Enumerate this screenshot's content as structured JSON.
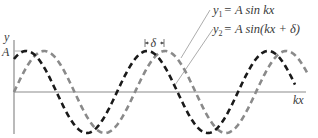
{
  "figure": {
    "y_axis_label": "y",
    "x_axis_label": "kx",
    "amplitude_label": "A",
    "phase_label": "δ",
    "equations": [
      {
        "lhs_var": "y",
        "lhs_sub": "1",
        "rhs": "= A sin kx",
        "curve": "gray"
      },
      {
        "lhs_var": "y",
        "lhs_sub": "2",
        "rhs": "= A sin(kx + δ)",
        "curve": "black"
      }
    ]
  },
  "colors": {
    "curve_y1": "#8a8a8a",
    "curve_y2": "#1a1a1a",
    "axis": "#8c8c8c",
    "text": "#3a3a3a"
  },
  "curves": {
    "period_px": 121,
    "amplitude_px": 41,
    "phase_shift_px": 18
  }
}
